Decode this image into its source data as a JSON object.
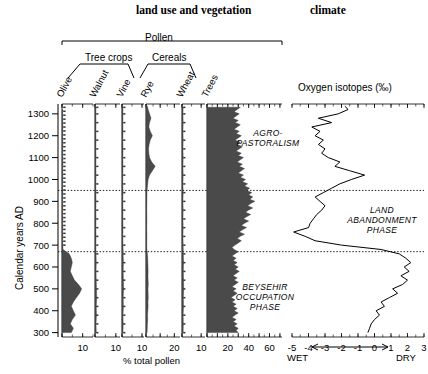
{
  "titles": {
    "left": "land use and vegetation",
    "right": "climate"
  },
  "groups": {
    "pollen": "Pollen",
    "tree_crops": "Tree crops",
    "cereals": "Cereals"
  },
  "taxa": [
    {
      "name": "Olive",
      "x0": 62,
      "x1": 93,
      "max": 15,
      "major": 10,
      "label_x": 62
    },
    {
      "name": "Walnut",
      "x0": 95,
      "x1": 120,
      "max": 12,
      "major": 10,
      "label_x": 95
    },
    {
      "name": "Vine",
      "x0": 122,
      "x1": 144,
      "max": 11,
      "major": 10,
      "label_x": 122
    },
    {
      "name": "Rye",
      "x0": 146,
      "x1": 180,
      "max": 24,
      "major": 20,
      "label_x": 146
    },
    {
      "name": "Wheat",
      "x0": 182,
      "x1": 205,
      "max": 12,
      "major": 10,
      "label_x": 182
    },
    {
      "name": "Trees",
      "x0": 207,
      "x1": 282,
      "max": 72,
      "major": 60,
      "label_x": 207
    }
  ],
  "axis": {
    "y_title": "Calendar years AD",
    "y_ticks": [
      300,
      400,
      500,
      600,
      700,
      800,
      900,
      1000,
      1100,
      1200,
      1300
    ],
    "y_min": 280,
    "y_max": 1345,
    "x_title": "% total pollen",
    "x_tick_labels": [
      "10",
      "10",
      "10",
      "20",
      "10",
      "20",
      "40",
      "60"
    ],
    "isotope_title": "Oxygen isotopes (‰)",
    "isotope_ticks": [
      "-5",
      "-4",
      "-3",
      "-2",
      "-1",
      "0",
      "1",
      "2",
      "3"
    ],
    "wet_label": "WET",
    "dry_label": "DRY"
  },
  "annotations": [
    {
      "id": "agro",
      "lines": [
        "AGRO-",
        "PASTORALISM"
      ],
      "x": 268,
      "y": 128
    },
    {
      "id": "land",
      "lines": [
        "LAND",
        "ABANDONMENT",
        "PHASE"
      ],
      "x": 382,
      "y": 205
    },
    {
      "id": "beysehir",
      "lines": [
        "BEYSEHIR",
        "OCCUPATION",
        "PHASE"
      ],
      "x": 265,
      "y": 282
    }
  ],
  "zone_boundaries": [
    950,
    670
  ],
  "chart_data": {
    "type": "area",
    "ylabel": "Calendar years AD",
    "xlabel": "% total pollen",
    "ylim": [
      280,
      1345
    ],
    "grid": false,
    "legend": "none",
    "zone_boundaries_ad": [
      950,
      670
    ],
    "zones": [
      {
        "name": "AGRO-PASTORALISM",
        "from_ad": 950,
        "to_ad": 1345
      },
      {
        "name": "LAND ABANDONMENT PHASE",
        "from_ad": 670,
        "to_ad": 950
      },
      {
        "name": "BEYSEHIR OCCUPATION PHASE",
        "from_ad": 280,
        "to_ad": 670
      }
    ],
    "series": [
      {
        "name": "Olive",
        "group": "Tree crops",
        "xlim": [
          0,
          15
        ],
        "xticks": [
          10
        ],
        "units": "% total pollen",
        "ad": [
          300,
          320,
          340,
          360,
          380,
          400,
          420,
          440,
          460,
          480,
          500,
          520,
          540,
          560,
          580,
          600,
          620,
          640,
          660,
          680,
          700,
          720,
          740,
          760,
          780,
          800,
          820,
          840,
          860,
          880,
          900,
          920,
          940,
          960,
          980,
          1000,
          1040,
          1080,
          1120,
          1160,
          1200,
          1240,
          1280,
          1320
        ],
        "values": [
          4.5,
          5.5,
          4.0,
          5.0,
          6.5,
          5.5,
          4.5,
          5.5,
          7.0,
          8.5,
          9.5,
          8.0,
          6.0,
          5.0,
          4.0,
          4.5,
          5.0,
          4.5,
          3.5,
          0.5,
          0.4,
          0.3,
          0.4,
          0.3,
          0.4,
          0.3,
          0.4,
          0.3,
          0.3,
          0.4,
          0.3,
          0.3,
          0.4,
          0.3,
          0.3,
          0.4,
          0.3,
          0.4,
          0.3,
          0.4,
          0.3,
          0.4,
          0.3,
          0.3
        ]
      },
      {
        "name": "Walnut",
        "group": "Tree crops",
        "xlim": [
          0,
          12
        ],
        "xticks": [
          10
        ],
        "units": "% total pollen",
        "ad": [
          300,
          340,
          380,
          420,
          460,
          500,
          540,
          580,
          620,
          660,
          700,
          740,
          780,
          820,
          860,
          900,
          940,
          980,
          1020,
          1060,
          1100,
          1140,
          1180,
          1220,
          1260,
          1300,
          1330
        ],
        "values": [
          0.6,
          0.5,
          0.7,
          0.6,
          0.8,
          0.7,
          0.6,
          0.5,
          0.6,
          0.5,
          0.4,
          0.5,
          0.4,
          0.5,
          0.4,
          0.5,
          0.4,
          0.4,
          0.5,
          0.4,
          0.5,
          0.4,
          0.5,
          0.4,
          0.5,
          0.4,
          0.5
        ]
      },
      {
        "name": "Vine",
        "group": "Tree crops",
        "xlim": [
          0,
          11
        ],
        "xticks": [
          10
        ],
        "units": "% total pollen",
        "ad": [
          300,
          340,
          380,
          420,
          460,
          500,
          540,
          580,
          620,
          660,
          700,
          740,
          780,
          820,
          860,
          900,
          940,
          980,
          1020,
          1060,
          1100,
          1140,
          1180,
          1220,
          1260,
          1300,
          1330
        ],
        "values": [
          0.5,
          0.6,
          0.5,
          0.7,
          0.6,
          0.8,
          0.7,
          0.6,
          0.7,
          0.6,
          0.5,
          0.4,
          0.5,
          0.4,
          0.5,
          0.4,
          0.5,
          0.4,
          0.4,
          0.5,
          0.4,
          0.5,
          0.4,
          0.5,
          0.4,
          0.5,
          0.4
        ]
      },
      {
        "name": "Rye",
        "group": "Cereals",
        "xlim": [
          0,
          24
        ],
        "xticks": [
          20
        ],
        "units": "% total pollen",
        "ad": [
          300,
          320,
          340,
          360,
          380,
          400,
          420,
          440,
          460,
          480,
          500,
          520,
          540,
          560,
          580,
          600,
          620,
          640,
          660,
          680,
          700,
          740,
          780,
          820,
          860,
          900,
          940,
          960,
          980,
          1000,
          1020,
          1040,
          1060,
          1080,
          1100,
          1120,
          1140,
          1160,
          1180,
          1200,
          1220,
          1240,
          1260,
          1280,
          1300,
          1320,
          1335
        ],
        "values": [
          0.8,
          0.9,
          1.0,
          1.2,
          1.1,
          1.3,
          1.5,
          1.4,
          1.6,
          1.5,
          1.4,
          1.6,
          1.5,
          1.4,
          1.5,
          1.4,
          1.3,
          1.2,
          1.0,
          0.6,
          0.5,
          0.6,
          0.5,
          0.6,
          0.5,
          0.6,
          0.7,
          0.9,
          1.2,
          1.5,
          2.5,
          4.5,
          6.5,
          4.0,
          2.5,
          2.0,
          1.8,
          2.2,
          3.0,
          4.5,
          3.0,
          2.0,
          2.5,
          3.5,
          2.5,
          1.5,
          1.0
        ]
      },
      {
        "name": "Wheat",
        "group": "Cereals",
        "xlim": [
          0,
          12
        ],
        "xticks": [
          10
        ],
        "units": "% total pollen",
        "ad": [
          300,
          340,
          380,
          420,
          460,
          500,
          540,
          580,
          620,
          660,
          700,
          740,
          780,
          820,
          860,
          900,
          940,
          980,
          1020,
          1060,
          1100,
          1140,
          1180,
          1220,
          1260,
          1300,
          1330
        ],
        "values": [
          0.6,
          0.7,
          0.6,
          0.8,
          0.7,
          0.9,
          0.8,
          0.7,
          0.8,
          0.7,
          0.6,
          0.5,
          0.6,
          0.5,
          0.6,
          0.5,
          0.6,
          0.5,
          0.6,
          0.5,
          0.6,
          0.5,
          0.6,
          0.5,
          0.6,
          0.5,
          0.6
        ]
      },
      {
        "name": "Trees",
        "group": "Pollen",
        "xlim": [
          0,
          72
        ],
        "xticks": [
          20,
          40,
          60
        ],
        "units": "% total pollen",
        "ad": [
          300,
          310,
          320,
          330,
          340,
          350,
          360,
          370,
          380,
          390,
          400,
          410,
          420,
          430,
          440,
          450,
          460,
          470,
          480,
          490,
          500,
          510,
          520,
          530,
          540,
          550,
          560,
          570,
          580,
          590,
          600,
          610,
          620,
          630,
          640,
          650,
          660,
          670,
          680,
          690,
          700,
          710,
          720,
          730,
          740,
          750,
          760,
          770,
          780,
          790,
          800,
          810,
          820,
          830,
          840,
          850,
          860,
          870,
          880,
          890,
          900,
          910,
          920,
          930,
          940,
          950,
          960,
          970,
          980,
          990,
          1000,
          1010,
          1020,
          1030,
          1040,
          1050,
          1060,
          1070,
          1080,
          1090,
          1100,
          1110,
          1120,
          1130,
          1140,
          1150,
          1160,
          1170,
          1180,
          1190,
          1200,
          1210,
          1220,
          1230,
          1240,
          1250,
          1260,
          1270,
          1280,
          1290,
          1300,
          1310,
          1320,
          1330
        ],
        "values": [
          30,
          28,
          30,
          26,
          29,
          25,
          28,
          24,
          27,
          30,
          26,
          29,
          25,
          28,
          24,
          27,
          23,
          26,
          29,
          25,
          28,
          24,
          27,
          30,
          26,
          29,
          25,
          28,
          31,
          27,
          30,
          26,
          29,
          25,
          28,
          24,
          27,
          30,
          26,
          24,
          27,
          30,
          33,
          29,
          32,
          36,
          31,
          34,
          38,
          33,
          36,
          40,
          35,
          38,
          42,
          37,
          40,
          44,
          39,
          42,
          46,
          41,
          44,
          40,
          43,
          38,
          41,
          36,
          39,
          34,
          37,
          32,
          35,
          30,
          33,
          36,
          31,
          34,
          29,
          32,
          35,
          30,
          33,
          28,
          31,
          34,
          29,
          32,
          27,
          30,
          33,
          28,
          31,
          26,
          29,
          32,
          27,
          30,
          25,
          28,
          31,
          26,
          29,
          32
        ]
      },
      {
        "name": "Oxygen isotopes",
        "group": "climate",
        "xlim": [
          -5,
          3
        ],
        "xticks": [
          -5,
          -4,
          -3,
          -2,
          -1,
          0,
          1,
          2,
          3
        ],
        "units": "‰",
        "direction_left": "WET",
        "direction_right": "DRY",
        "ad": [
          300,
          320,
          340,
          360,
          380,
          400,
          420,
          440,
          460,
          480,
          500,
          520,
          540,
          560,
          580,
          600,
          620,
          640,
          660,
          680,
          700,
          720,
          740,
          760,
          780,
          800,
          820,
          840,
          860,
          880,
          900,
          920,
          940,
          960,
          980,
          1000,
          1020,
          1040,
          1060,
          1080,
          1100,
          1120,
          1140,
          1160,
          1180,
          1200,
          1220,
          1240,
          1260,
          1280,
          1300,
          1320,
          1335
        ],
        "values": [
          -0.4,
          -0.3,
          -0.2,
          0.0,
          0.3,
          0.1,
          0.6,
          0.4,
          0.9,
          1.4,
          1.1,
          1.7,
          2.0,
          1.6,
          2.1,
          1.8,
          2.2,
          1.9,
          1.5,
          0.4,
          -2.0,
          -3.6,
          -4.2,
          -4.9,
          -4.0,
          -3.9,
          -3.7,
          -3.5,
          -3.2,
          -3.0,
          -3.3,
          -3.6,
          -3.1,
          -2.6,
          -2.1,
          -1.4,
          -0.6,
          -1.5,
          -2.4,
          -2.1,
          -2.8,
          -3.2,
          -3.0,
          -3.4,
          -3.1,
          -3.6,
          -3.3,
          -3.8,
          -2.6,
          -3.4,
          -2.2,
          -1.6,
          -1.8
        ]
      }
    ]
  }
}
